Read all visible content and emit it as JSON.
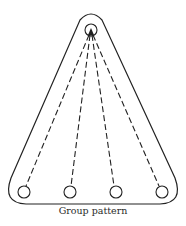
{
  "caption": "Group pattern",
  "colors": {
    "stroke": "#222222",
    "background": "#ffffff"
  },
  "diagram": {
    "apex_hole": {
      "cx": 91,
      "cy": 30,
      "r": 6
    },
    "bottom_holes": [
      {
        "cx": 24,
        "cy": 192,
        "r": 6
      },
      {
        "cx": 70,
        "cy": 192,
        "r": 6
      },
      {
        "cx": 116,
        "cy": 192,
        "r": 6
      },
      {
        "cx": 162,
        "cy": 192,
        "r": 6
      }
    ]
  }
}
